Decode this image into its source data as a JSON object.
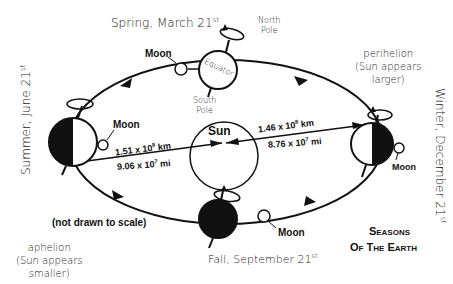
{
  "title": {
    "line1": "Seasons",
    "line2": "of the Earth"
  },
  "note": "(not drawn to scale)",
  "seasons": {
    "spring": {
      "label": "Spring, March 21",
      "sup": "st"
    },
    "summer": {
      "label": "Summer, June 21",
      "sup": "st"
    },
    "fall": {
      "label": "Fall, September 21",
      "sup": "st"
    },
    "winter": {
      "label": "Winter, December 21",
      "sup": "st"
    }
  },
  "labels": {
    "north_pole": [
      "North",
      "Pole"
    ],
    "south_pole": [
      "South",
      "Pole"
    ],
    "equator": "Equator",
    "sun": "Sun",
    "moon": "Moon"
  },
  "perihelion": {
    "line1": "perihelion",
    "line2": "(Sun appears",
    "line3": "larger)"
  },
  "aphelion": {
    "line1": "aphelion",
    "line2": "(Sun appears",
    "line3": "smaller)"
  },
  "distances": {
    "aphelion_km": "1.51 x 10",
    "aphelion_km_exp": "8",
    "aphelion_km_unit": " km",
    "aphelion_mi": "9.06 x 10",
    "aphelion_mi_exp": "7",
    "aphelion_mi_unit": " mi",
    "perihelion_km": "1.46 x 10",
    "perihelion_km_exp": "8",
    "perihelion_km_unit": " km",
    "perihelion_mi": "8.76 x 10",
    "perihelion_mi_exp": "7",
    "perihelion_mi_unit": " mi"
  }
}
